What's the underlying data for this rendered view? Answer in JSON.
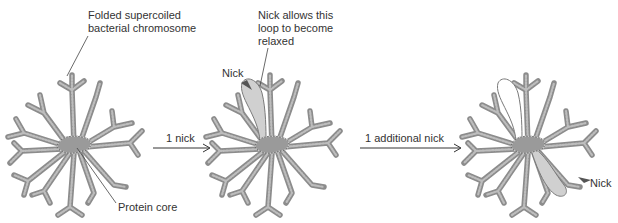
{
  "figure": {
    "stages": [
      {
        "id": "supercoiled",
        "labels": {
          "top": "Folded supercoiled\nbacterial chromosome",
          "bottom": "Protein core"
        },
        "relaxed_loops": 0
      },
      {
        "id": "one-nick",
        "labels": {
          "top": "Nick allows this\nloop to become\nrelaxed",
          "nick": "Nick"
        },
        "relaxed_loops": 1
      },
      {
        "id": "two-nicks",
        "labels": {
          "nick": "Nick"
        },
        "relaxed_loops": 2
      }
    ],
    "transitions": [
      {
        "label": "1 nick",
        "from": "supercoiled",
        "to": "one-nick"
      },
      {
        "label": "1 additional nick",
        "from": "one-nick",
        "to": "two-nicks"
      }
    ],
    "colors": {
      "strand": "#8c8c8c",
      "relaxed_loop_fill": "#d0d0d0",
      "text": "#333333",
      "background": "#ffffff"
    }
  }
}
